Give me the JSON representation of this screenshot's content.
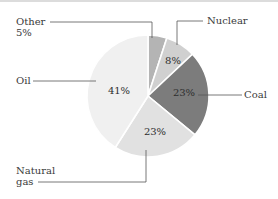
{
  "chart_data": {
    "type": "pie",
    "title": "",
    "categories": [
      "Other",
      "Nuclear",
      "Coal",
      "Natural gas",
      "Oil"
    ],
    "values": [
      5,
      8,
      23,
      23,
      41
    ],
    "unit": "%",
    "colors": [
      "#b4b4b4",
      "#d0d0d0",
      "#7c7c7c",
      "#e1e1e1",
      "#f0f0f0"
    ],
    "start_angle_deg_clockwise_from_top": 0,
    "legend": "none (leader-line labels)"
  },
  "labels": {
    "other_name": "Other",
    "other_pct": "5%",
    "nuclear_name": "Nuclear",
    "nuclear_pct": "8%",
    "coal_name": "Coal",
    "coal_pct": "23%",
    "gas_name_line1": "Natural",
    "gas_name_line2": "gas",
    "gas_pct": "23%",
    "oil_name": "Oil",
    "oil_pct": "41%"
  }
}
